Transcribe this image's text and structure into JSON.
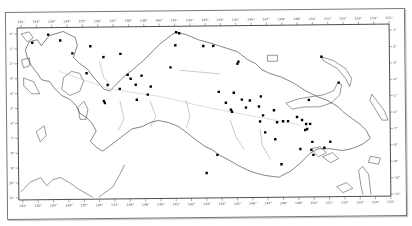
{
  "map": {
    "region": "New Guinea",
    "style": "outline map with locality dots",
    "frame": {
      "x": 18,
      "y": 24,
      "width": 372,
      "height": 172
    },
    "longitude_labels_top": [
      "131°",
      "132°",
      "133°",
      "134°",
      "135°",
      "136°",
      "137°",
      "138°",
      "139°",
      "140°",
      "141°",
      "142°",
      "143°",
      "144°",
      "145°",
      "146°",
      "147°",
      "148°",
      "149°",
      "150°",
      "151°",
      "152°",
      "153°",
      "154°",
      "155°"
    ],
    "longitude_labels_bottom": [
      "131°",
      "132°",
      "133°",
      "134°",
      "135°",
      "136°",
      "137°",
      "138°",
      "139°",
      "140°",
      "141°",
      "142°",
      "143°",
      "144°",
      "145°",
      "146°",
      "147°",
      "148°",
      "149°",
      "150°",
      "151°",
      "152°",
      "153°",
      "154°",
      "155°"
    ],
    "latitude_labels_left": [
      "0°",
      "1°",
      "2°",
      "3°",
      "4°",
      "5°",
      "6°",
      "7°",
      "8°",
      "9°",
      "10°",
      "11°"
    ],
    "latitude_labels_right": [
      "1°",
      "2°",
      "3°",
      "4°",
      "5°",
      "6°",
      "7°",
      "8°",
      "9°",
      "10°",
      "11°"
    ],
    "colors": {
      "coast": "#333333",
      "rivers": "#666666",
      "dots": "#000000",
      "frame": "#222222"
    },
    "locality_points": [
      [
        49,
        33
      ],
      [
        61,
        39
      ],
      [
        33,
        41
      ],
      [
        73,
        52
      ],
      [
        91,
        45
      ],
      [
        87,
        72
      ],
      [
        104,
        56
      ],
      [
        108,
        84
      ],
      [
        121,
        53
      ],
      [
        128,
        74
      ],
      [
        131,
        78
      ],
      [
        142,
        75
      ],
      [
        120,
        88
      ],
      [
        136,
        84
      ],
      [
        148,
        94
      ],
      [
        104,
        100
      ],
      [
        105,
        102
      ],
      [
        137,
        99
      ],
      [
        151,
        86
      ],
      [
        177,
        32
      ],
      [
        180,
        33
      ],
      [
        176,
        45
      ],
      [
        204,
        46
      ],
      [
        214,
        46
      ],
      [
        171,
        67
      ],
      [
        239,
        62
      ],
      [
        238,
        64
      ],
      [
        234,
        93
      ],
      [
        219,
        92
      ],
      [
        226,
        103
      ],
      [
        231,
        110
      ],
      [
        232,
        112
      ],
      [
        242,
        100
      ],
      [
        246,
        108
      ],
      [
        250,
        101
      ],
      [
        259,
        107
      ],
      [
        263,
        116
      ],
      [
        260,
        122
      ],
      [
        274,
        111
      ],
      [
        283,
        122
      ],
      [
        288,
        122
      ],
      [
        297,
        118
      ],
      [
        302,
        121
      ],
      [
        306,
        125
      ],
      [
        305,
        131
      ],
      [
        307,
        130
      ],
      [
        310,
        125
      ],
      [
        312,
        143
      ],
      [
        324,
        149
      ],
      [
        330,
        143
      ],
      [
        311,
        151
      ],
      [
        313,
        156
      ],
      [
        300,
        150
      ],
      [
        275,
        140
      ],
      [
        265,
        133
      ],
      [
        261,
        97
      ],
      [
        322,
        58
      ],
      [
        339,
        84
      ],
      [
        309,
        101
      ],
      [
        277,
        123
      ],
      [
        217,
        155
      ],
      [
        206,
        173
      ],
      [
        281,
        165
      ]
    ]
  }
}
